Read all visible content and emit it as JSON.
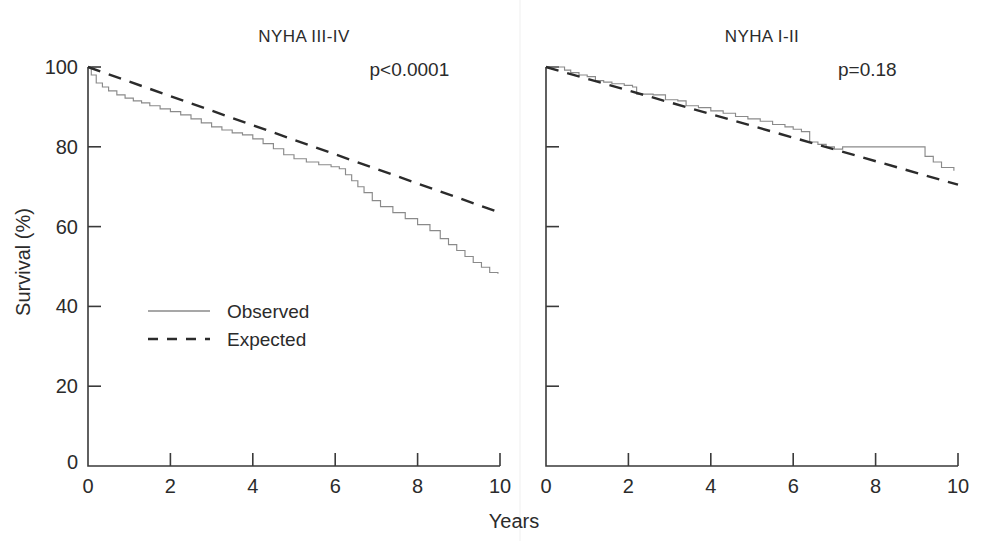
{
  "figure": {
    "width": 988,
    "height": 541,
    "background": "#ffffff",
    "shared_xlabel": "Years",
    "shared_ylabel": "Survival (%)"
  },
  "colors": {
    "observed": "#8a8a8a",
    "expected": "#2b2b2b",
    "axis": "#3a3a3a",
    "text": "#2b2b2b"
  },
  "legend": {
    "position": "inside-left-panel",
    "entries": [
      {
        "label": "Observed",
        "style": "solid",
        "series": "observed"
      },
      {
        "label": "Expected",
        "style": "dashed",
        "series": "expected"
      }
    ]
  },
  "chart_data": [
    {
      "type": "line",
      "panel": "left",
      "title": "NYHA III-IV",
      "annotation": "p<0.0001",
      "xlabel": "Years",
      "ylabel": "Survival (%)",
      "xlim": [
        0,
        10
      ],
      "ylim": [
        0,
        100
      ],
      "xticks": [
        0,
        2,
        4,
        6,
        8,
        10
      ],
      "xtick_labels": [
        "0",
        "2",
        "4",
        "6",
        "8",
        "10"
      ],
      "yticks": [
        0,
        20,
        40,
        60,
        80,
        100
      ],
      "ytick_labels": [
        "0",
        "20",
        "40",
        "60",
        "80",
        "100"
      ],
      "grid": false,
      "series": [
        {
          "name": "Observed",
          "style": "step",
          "x": [
            0.0,
            0.08,
            0.2,
            0.35,
            0.5,
            0.7,
            0.9,
            1.1,
            1.3,
            1.5,
            1.75,
            2.0,
            2.25,
            2.5,
            2.75,
            3.0,
            3.25,
            3.5,
            3.75,
            4.0,
            4.25,
            4.5,
            4.75,
            5.0,
            5.3,
            5.6,
            5.9,
            6.1,
            6.25,
            6.4,
            6.55,
            6.7,
            6.9,
            7.1,
            7.4,
            7.7,
            8.0,
            8.3,
            8.55,
            8.75,
            8.95,
            9.15,
            9.35,
            9.55,
            9.75,
            9.95
          ],
          "y": [
            100.0,
            98.0,
            96.0,
            95.0,
            94.0,
            93.0,
            92.2,
            91.5,
            91.0,
            90.3,
            89.5,
            88.8,
            88.0,
            87.0,
            86.0,
            85.0,
            84.2,
            83.5,
            83.0,
            82.0,
            80.8,
            79.5,
            78.0,
            77.0,
            76.2,
            75.5,
            75.0,
            74.5,
            73.0,
            71.5,
            70.0,
            68.5,
            66.5,
            65.0,
            63.5,
            62.0,
            60.5,
            59.0,
            57.0,
            55.5,
            54.0,
            52.5,
            51.0,
            49.8,
            48.5,
            48.2
          ]
        },
        {
          "name": "Expected",
          "style": "linear-dashed",
          "x": [
            0,
            10
          ],
          "y": [
            100.0,
            63.5
          ]
        }
      ]
    },
    {
      "type": "line",
      "panel": "right",
      "title": "NYHA I-II",
      "annotation": "p=0.18",
      "xlabel": "Years",
      "ylabel": "Survival (%)",
      "xlim": [
        0,
        10
      ],
      "ylim": [
        0,
        100
      ],
      "xticks": [
        0,
        2,
        4,
        6,
        8,
        10
      ],
      "xtick_labels": [
        "0",
        "2",
        "4",
        "6",
        "8",
        "10"
      ],
      "yticks": [
        0,
        20,
        40,
        60,
        80,
        100
      ],
      "ytick_labels": [
        "",
        "",
        "",
        "",
        "",
        ""
      ],
      "grid": false,
      "series": [
        {
          "name": "Observed",
          "style": "step",
          "x": [
            0.0,
            0.3,
            0.45,
            0.6,
            0.8,
            1.0,
            1.2,
            1.4,
            1.6,
            1.9,
            2.1,
            2.2,
            2.6,
            2.9,
            3.2,
            3.4,
            3.7,
            4.0,
            4.3,
            4.6,
            4.9,
            5.2,
            5.5,
            5.8,
            6.0,
            6.2,
            6.4,
            6.6,
            6.8,
            7.0,
            7.2,
            9.0,
            9.2,
            9.4,
            9.6,
            9.9
          ],
          "y": [
            100.0,
            100.0,
            99.2,
            98.6,
            98.0,
            97.6,
            96.6,
            96.2,
            95.8,
            95.4,
            95.0,
            93.2,
            93.0,
            91.8,
            91.5,
            90.3,
            89.8,
            89.0,
            88.4,
            87.6,
            87.0,
            86.4,
            85.6,
            85.0,
            84.4,
            83.8,
            81.2,
            80.6,
            80.0,
            79.4,
            80.0,
            80.0,
            77.6,
            76.2,
            74.8,
            74.0
          ]
        },
        {
          "name": "Expected",
          "style": "linear-dashed",
          "x": [
            0,
            10
          ],
          "y": [
            100.0,
            70.5
          ]
        }
      ]
    }
  ]
}
